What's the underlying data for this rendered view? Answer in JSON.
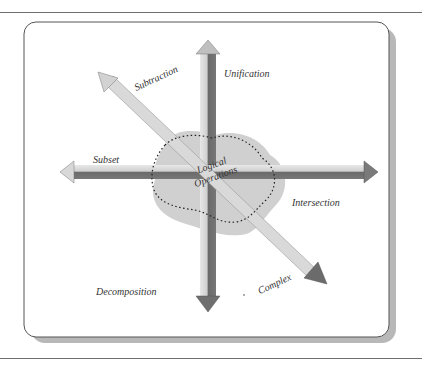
{
  "diagram": {
    "center_label": [
      "Logical",
      "Operations"
    ],
    "labels": {
      "subtraction": "Subtraction",
      "unification": "Unification",
      "subset": "Subset",
      "intersection": "Intersection",
      "decomposition": "Decomposition",
      "complex": "Complex"
    },
    "colors": {
      "arrow_light": "#e4e4e4",
      "arrow_mid": "#bdbdbd",
      "arrow_dark": "#6a6a6a",
      "blob_fill": "#c9c9c9",
      "panel_border": "#555555",
      "panel_shadow": "#b5b5b5"
    }
  }
}
